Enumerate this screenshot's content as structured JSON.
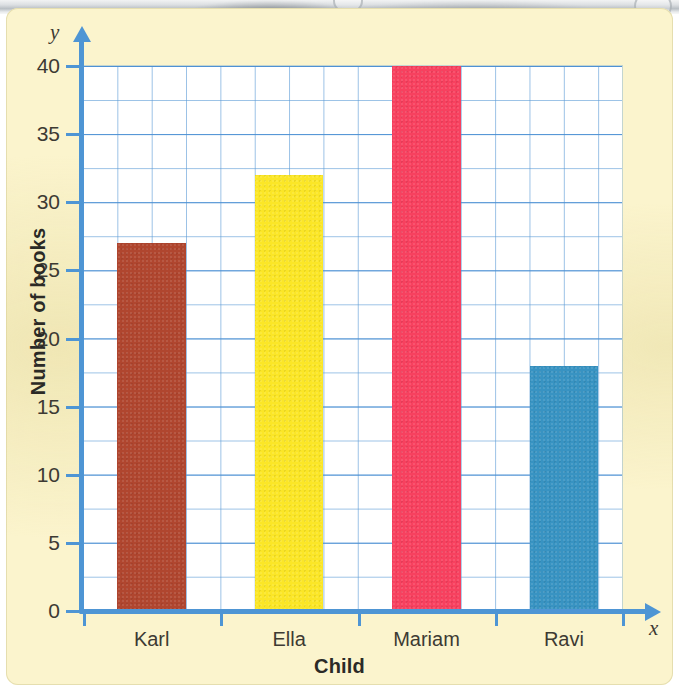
{
  "chart_data": {
    "type": "bar",
    "title": "",
    "categories": [
      "Karl",
      "Ella",
      "Mariam",
      "Ravi"
    ],
    "values": [
      27,
      32,
      40,
      18
    ],
    "series": [
      {
        "name": "Number of books",
        "values": [
          27,
          32,
          40,
          18
        ]
      }
    ],
    "colors": [
      "#b0462f",
      "#fbe627",
      "#f7415f",
      "#3893c2"
    ],
    "xlabel": "Child",
    "ylabel": "Number of books",
    "x_axis_letter": "x",
    "y_axis_letter": "y",
    "ylim": [
      0,
      40
    ],
    "ytick_step": 5,
    "yticks": [
      0,
      5,
      10,
      15,
      20,
      25,
      30,
      35,
      40
    ],
    "ytick_labels": [
      "0",
      "5",
      "10",
      "15",
      "20",
      "25",
      "30",
      "35",
      "40"
    ],
    "minor_grid_step": 2.5,
    "grid": true,
    "legend": "none",
    "grid_color": "#5c9bd6",
    "axis_color": "#4e95d4",
    "page_color": "#fbf4cd",
    "plot_background": "#ffffff",
    "text_color": "#3d3a33"
  }
}
